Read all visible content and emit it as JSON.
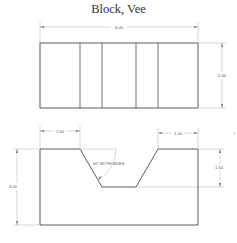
{
  "title": "Block, Vee",
  "top_view": {
    "width_dim": "6.00",
    "height_dim": "2.40"
  },
  "front_view": {
    "left_top_dim": "1.00",
    "right_top_dim": "1.00",
    "overall_height_dim": "3.00",
    "groove_depth_dim": "1.50",
    "angle_note": "60° BOTH SIDES"
  },
  "colors": {
    "outline": "#333333",
    "dimension": "#888888",
    "background": "#ffffff"
  }
}
